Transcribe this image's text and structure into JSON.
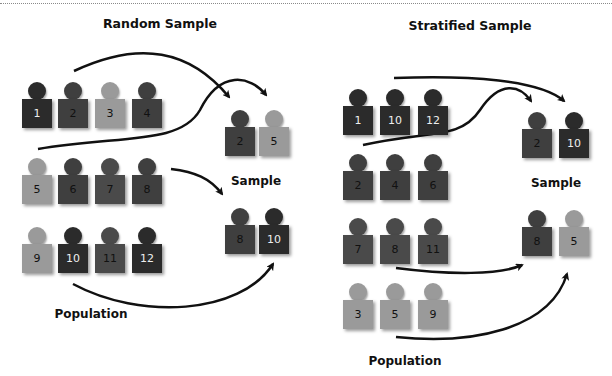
{
  "colors": {
    "darkest": "#2b2b2b",
    "dark": "#3f3f3f",
    "medium": "#4a4a4a",
    "light": "#9a9a9a",
    "arrow": "#111111"
  },
  "random": {
    "title": "Random Sample",
    "population_label": "Population",
    "sample_label": "Sample",
    "population": [
      {
        "n": "1",
        "shade": "darkest"
      },
      {
        "n": "2",
        "shade": "dark"
      },
      {
        "n": "3",
        "shade": "light"
      },
      {
        "n": "4",
        "shade": "dark"
      },
      {
        "n": "5",
        "shade": "light"
      },
      {
        "n": "6",
        "shade": "dark"
      },
      {
        "n": "7",
        "shade": "medium"
      },
      {
        "n": "8",
        "shade": "dark"
      },
      {
        "n": "9",
        "shade": "light"
      },
      {
        "n": "10",
        "shade": "darkest"
      },
      {
        "n": "11",
        "shade": "medium"
      },
      {
        "n": "12",
        "shade": "darkest"
      }
    ],
    "sample": [
      {
        "n": "2",
        "shade": "dark"
      },
      {
        "n": "5",
        "shade": "light"
      },
      {
        "n": "8",
        "shade": "dark"
      },
      {
        "n": "10",
        "shade": "darkest"
      }
    ]
  },
  "stratified": {
    "title": "Stratified Sample",
    "population_label": "Population",
    "sample_label": "Sample",
    "population": [
      {
        "n": "1",
        "shade": "darkest"
      },
      {
        "n": "10",
        "shade": "darkest"
      },
      {
        "n": "12",
        "shade": "darkest"
      },
      {
        "n": "2",
        "shade": "dark"
      },
      {
        "n": "4",
        "shade": "dark"
      },
      {
        "n": "6",
        "shade": "dark"
      },
      {
        "n": "7",
        "shade": "medium"
      },
      {
        "n": "8",
        "shade": "medium"
      },
      {
        "n": "11",
        "shade": "medium"
      },
      {
        "n": "3",
        "shade": "light"
      },
      {
        "n": "5",
        "shade": "light"
      },
      {
        "n": "9",
        "shade": "light"
      }
    ],
    "sample": [
      {
        "n": "2",
        "shade": "dark"
      },
      {
        "n": "10",
        "shade": "darkest"
      },
      {
        "n": "8",
        "shade": "dark"
      },
      {
        "n": "5",
        "shade": "light"
      }
    ]
  }
}
